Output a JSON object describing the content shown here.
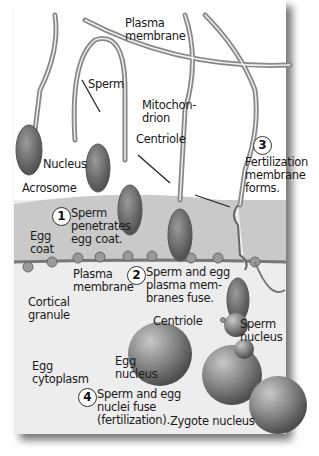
{
  "diagram": {
    "title": "Fertilization",
    "colors": {
      "background": "#ededed",
      "egg_coat": "#c9c9c9",
      "sperm_body": "#8a8a8a",
      "nucleus": "#6e6e6e",
      "border_shadow": "#7a7a7a"
    },
    "labels": {
      "plasma_membrane_top": "Plasma\nmembrane",
      "sperm": "Sperm",
      "mitochondrion": "Mitochon-\ndrion",
      "centriole_top": "Centriole",
      "nucleus": "Nucleus",
      "acrosome": "Acrosome",
      "egg_coat": "Egg\ncoat",
      "plasma_membrane_bottom": "Plasma\nmembrane",
      "cortical_granule": "Cortical\ngranule",
      "centriole_bottom": "Centriole",
      "sperm_nucleus": "Sperm\nnucleus",
      "egg_nucleus": "Egg\nnucleus",
      "egg_cytoplasm": "Egg\ncytoplasm",
      "zygote_nucleus": "Zygote nucleus"
    },
    "steps": [
      {
        "number": "1",
        "text": "Sperm\npenetrates\negg coat."
      },
      {
        "number": "2",
        "text": "Sperm and egg\nplasma mem-\nbranes fuse."
      },
      {
        "number": "3",
        "text": "Fertilization\nmembrane\nforms."
      },
      {
        "number": "4",
        "text": "Sperm and egg\nnuclei fuse\n(fertilization)."
      }
    ]
  }
}
